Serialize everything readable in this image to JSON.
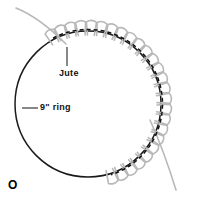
{
  "figure": {
    "marker": "O",
    "background_color": "#ffffff",
    "width": 206,
    "height": 198
  },
  "ring": {
    "center_x": 88,
    "center_y": 104,
    "radius": 73,
    "stroke_color": "#1a1a1a",
    "stroke_width": 1.5
  },
  "yarn": {
    "color": "#b8b8b8",
    "stroke_width": 1.6,
    "stitch_count": 26,
    "stitch_start_angle": -118,
    "stitch_end_angle": 72,
    "thread_color": "#111111",
    "thread_dash": "4 3",
    "tail_start": "M 16 8 C 36 16, 52 30, 66 44",
    "tail_end": "M 150 120 C 160 142, 168 164, 176 190"
  },
  "labels": {
    "jute": {
      "text": "Jute",
      "leader": "M 67 66 L 67 47"
    },
    "ring": {
      "text": "9\" ring",
      "leader": "M 38 108 L 22 108"
    }
  }
}
